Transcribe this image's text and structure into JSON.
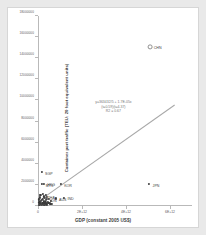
{
  "chart_data": {
    "type": "scatter",
    "title": "",
    "xlabel": "GDP (constant 2005 US$)",
    "ylabel": "Container port traffic (TEU: 20 foot equivalent units)",
    "xlim": [
      0,
      7000000000000
    ],
    "ylim": [
      0,
      18000000
    ],
    "grid": false,
    "legend": "none",
    "xticks": [
      {
        "value": 0,
        "label": "0"
      },
      {
        "value": 2000000000000,
        "label": "2E+12"
      },
      {
        "value": 4000000000000,
        "label": "4E+12"
      },
      {
        "value": 6000000000000,
        "label": "6E+12"
      }
    ],
    "yticks": [
      {
        "value": 0,
        "label": "0"
      },
      {
        "value": 2000000,
        "label": "2000000"
      },
      {
        "value": 4000000,
        "label": "4000000"
      },
      {
        "value": 6000000,
        "label": "6000000"
      },
      {
        "value": 8000000,
        "label": "8000000"
      },
      {
        "value": 10000000,
        "label": "10000000"
      },
      {
        "value": 12000000,
        "label": "12000000"
      },
      {
        "value": 14000000,
        "label": "14000000"
      },
      {
        "value": 16000000,
        "label": "16000000"
      },
      {
        "value": 18000000,
        "label": "18000000"
      }
    ],
    "annotation": {
      "line1": "y=363432/5 + 1.7E-05x",
      "line2": "(t=0.59)(t=4.37)",
      "line3": "R2 = 0.67"
    },
    "trendline": {
      "x0": 0,
      "y0": 363432,
      "x1": 6200000000000,
      "y1": 9500000
    },
    "points": [
      {
        "label": "CHN",
        "x": 5100000000000,
        "y": 15100000,
        "style": "hollow"
      },
      {
        "label": "JPN",
        "x": 5050000000000,
        "y": 2050000,
        "style": "solid"
      },
      {
        "label": "SGP",
        "x": 160000000000,
        "y": 3200000,
        "style": "solid"
      },
      {
        "label": "KOR",
        "x": 1030000000000,
        "y": 2050000,
        "style": "solid"
      },
      {
        "label": "AUS",
        "x": 800000000000,
        "y": 700000,
        "style": "solid"
      },
      {
        "label": "IND",
        "x": 1180000000000,
        "y": 780000,
        "style": "solid"
      },
      {
        "label": "MYS",
        "x": 190000000000,
        "y": 2050000,
        "style": "solid"
      },
      {
        "label": "HKG",
        "x": 260000000000,
        "y": 2100000,
        "style": "solid"
      },
      {
        "label": "THA",
        "x": 280000000000,
        "y": 900000,
        "style": "solid"
      },
      {
        "label": "IDN",
        "x": 400000000000,
        "y": 620000,
        "style": "solid"
      },
      {
        "label": "",
        "x": 60000000000,
        "y": 330000,
        "style": "solid"
      },
      {
        "label": "",
        "x": 95000000000,
        "y": 260000,
        "style": "solid"
      },
      {
        "label": "",
        "x": 130000000000,
        "y": 450000,
        "style": "solid"
      },
      {
        "label": "",
        "x": 150000000000,
        "y": 180000,
        "style": "solid"
      },
      {
        "label": "",
        "x": 180000000000,
        "y": 560000,
        "style": "solid"
      },
      {
        "label": "",
        "x": 200000000000,
        "y": 300000,
        "style": "solid"
      },
      {
        "label": "",
        "x": 215000000000,
        "y": 680000,
        "style": "solid"
      },
      {
        "label": "",
        "x": 240000000000,
        "y": 170000,
        "style": "solid"
      },
      {
        "label": "",
        "x": 265000000000,
        "y": 420000,
        "style": "solid"
      },
      {
        "label": "",
        "x": 290000000000,
        "y": 250000,
        "style": "solid"
      },
      {
        "label": "",
        "x": 310000000000,
        "y": 760000,
        "style": "solid"
      },
      {
        "label": "",
        "x": 335000000000,
        "y": 330000,
        "style": "solid"
      },
      {
        "label": "",
        "x": 360000000000,
        "y": 540000,
        "style": "solid"
      },
      {
        "label": "",
        "x": 385000000000,
        "y": 190000,
        "style": "solid"
      },
      {
        "label": "",
        "x": 410000000000,
        "y": 880000,
        "style": "solid"
      },
      {
        "label": "",
        "x": 440000000000,
        "y": 400000,
        "style": "solid"
      },
      {
        "label": "",
        "x": 470000000000,
        "y": 240000,
        "style": "solid"
      },
      {
        "label": "",
        "x": 500000000000,
        "y": 620000,
        "style": "solid"
      },
      {
        "label": "",
        "x": 530000000000,
        "y": 310000,
        "style": "solid"
      },
      {
        "label": "",
        "x": 560000000000,
        "y": 150000,
        "style": "solid"
      },
      {
        "label": "",
        "x": 30000000000,
        "y": 120000,
        "style": "solid"
      },
      {
        "label": "",
        "x": 45000000000,
        "y": 600000,
        "style": "solid"
      },
      {
        "label": "",
        "x": 70000000000,
        "y": 800000,
        "style": "solid"
      },
      {
        "label": "",
        "x": 110000000000,
        "y": 1000000,
        "style": "solid"
      },
      {
        "label": "",
        "x": 225000000000,
        "y": 1150000,
        "style": "solid"
      },
      {
        "label": "",
        "x": 350000000000,
        "y": 1050000,
        "style": "solid"
      },
      {
        "label": "",
        "x": 600000000000,
        "y": 430000,
        "style": "solid"
      },
      {
        "label": "",
        "x": 650000000000,
        "y": 210000,
        "style": "solid"
      },
      {
        "label": "",
        "x": 85000000000,
        "y": 80000,
        "style": "solid"
      },
      {
        "label": "",
        "x": 170000000000,
        "y": 90000,
        "style": "solid"
      },
      {
        "label": "",
        "x": 255000000000,
        "y": 70000,
        "style": "solid"
      },
      {
        "label": "",
        "x": 320000000000,
        "y": 110000,
        "style": "solid"
      },
      {
        "label": "",
        "x": 420000000000,
        "y": 60000,
        "style": "solid"
      }
    ]
  }
}
